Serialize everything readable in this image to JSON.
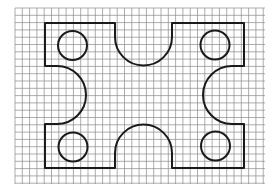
{
  "diagram": {
    "type": "gasket-plate-on-grid",
    "background": "#ffffff",
    "grid": {
      "x0": 15,
      "y0": 8,
      "x1": 265,
      "y1": 184,
      "cell": 7.3,
      "color": "#8a8a8a"
    },
    "outline": {
      "color": "#1a1a1a",
      "stroke_width": 2,
      "left": 45,
      "top": 23,
      "right": 244,
      "bottom": 168,
      "top_notch": {
        "x_left": 115,
        "x_right": 172,
        "straight_to": 37,
        "radius": 28.5
      },
      "bottom_notch": {
        "x_left": 115,
        "x_right": 172,
        "straight_to": 153,
        "radius": 28.5
      },
      "left_notch": {
        "y_top": 66,
        "y_bottom": 124,
        "straight_to": 57,
        "radius": 29
      },
      "right_notch": {
        "y_top": 66,
        "y_bottom": 124,
        "straight_to": 232,
        "radius": 29
      }
    },
    "holes": [
      {
        "name": "top-left-hole",
        "cx": 72.5,
        "cy": 45.5,
        "r": 14.5
      },
      {
        "name": "top-right-hole",
        "cx": 215,
        "cy": 45,
        "r": 14.5
      },
      {
        "name": "bottom-left-hole",
        "cx": 73,
        "cy": 147,
        "r": 14.5
      },
      {
        "name": "bottom-right-hole",
        "cx": 215.5,
        "cy": 146,
        "r": 14.5
      }
    ]
  }
}
